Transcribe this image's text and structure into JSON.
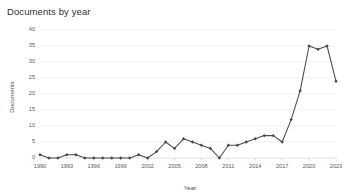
{
  "chart_data": {
    "type": "line",
    "title": "Documents by year",
    "xlabel": "Year",
    "ylabel": "Documents",
    "xlim": [
      1990,
      2023
    ],
    "ylim": [
      0,
      40
    ],
    "grid": true,
    "legend": "none",
    "marker": "diamond",
    "line_color": "#4a4a4a",
    "grid_color": "#e8e8e8",
    "x_tick_labels": [
      "1990",
      "1993",
      "1996",
      "1999",
      "2002",
      "2005",
      "2008",
      "2011",
      "2014",
      "2017",
      "2020",
      "2023"
    ],
    "x_tick_values": [
      1990,
      1993,
      1996,
      1999,
      2002,
      2005,
      2008,
      2011,
      2014,
      2017,
      2020,
      2023
    ],
    "y_tick_labels": [
      "0",
      "5",
      "10",
      "15",
      "20",
      "25",
      "30",
      "35",
      "40"
    ],
    "y_tick_values": [
      0,
      5,
      10,
      15,
      20,
      25,
      30,
      35,
      40
    ],
    "x": [
      1990,
      1991,
      1992,
      1993,
      1994,
      1995,
      1996,
      1997,
      1998,
      1999,
      2000,
      2001,
      2002,
      2003,
      2004,
      2005,
      2006,
      2007,
      2008,
      2009,
      2010,
      2011,
      2012,
      2013,
      2014,
      2015,
      2016,
      2017,
      2018,
      2019,
      2020,
      2021,
      2022,
      2023
    ],
    "values": [
      1,
      0,
      0,
      1,
      1,
      0,
      0,
      0,
      0,
      0,
      0,
      1,
      0,
      2,
      5,
      3,
      6,
      5,
      4,
      3,
      0,
      4,
      4,
      5,
      6,
      7,
      7,
      5,
      12,
      21,
      35,
      34,
      35,
      24
    ],
    "series": [
      {
        "name": "Documents",
        "values": [
          1,
          0,
          0,
          1,
          1,
          0,
          0,
          0,
          0,
          0,
          0,
          1,
          0,
          2,
          5,
          3,
          6,
          5,
          4,
          3,
          0,
          4,
          4,
          5,
          6,
          7,
          7,
          5,
          12,
          21,
          35,
          34,
          35,
          24
        ]
      }
    ]
  }
}
